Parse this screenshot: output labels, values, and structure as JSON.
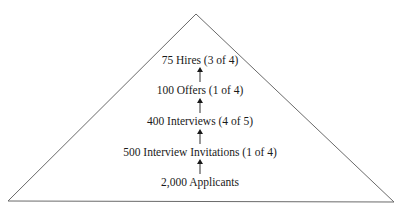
{
  "diagram": {
    "type": "pyramid-funnel",
    "shape": {
      "apex": [
        196,
        14
      ],
      "base_left": [
        8,
        201
      ],
      "base_right": [
        394,
        202
      ],
      "stroke": "#555555"
    },
    "stages": [
      {
        "label": "75 Hires (3 of 4)",
        "count": "75",
        "name": "Hires",
        "ratio": "3 of 4"
      },
      {
        "label": "100 Offers (1 of 4)",
        "count": "100",
        "name": "Offers",
        "ratio": "1 of 4"
      },
      {
        "label": "400 Interviews (4 of 5)",
        "count": "400",
        "name": "Interviews",
        "ratio": "4 of 5"
      },
      {
        "label": "500 Interview Invitations (1 of 4)",
        "count": "500",
        "name": "Interview Invitations",
        "ratio": "1 of 4"
      },
      {
        "label": "2,000 Applicants",
        "count": "2,000",
        "name": "Applicants",
        "ratio": ""
      }
    ],
    "arrow_color": "#1a1a1a"
  }
}
